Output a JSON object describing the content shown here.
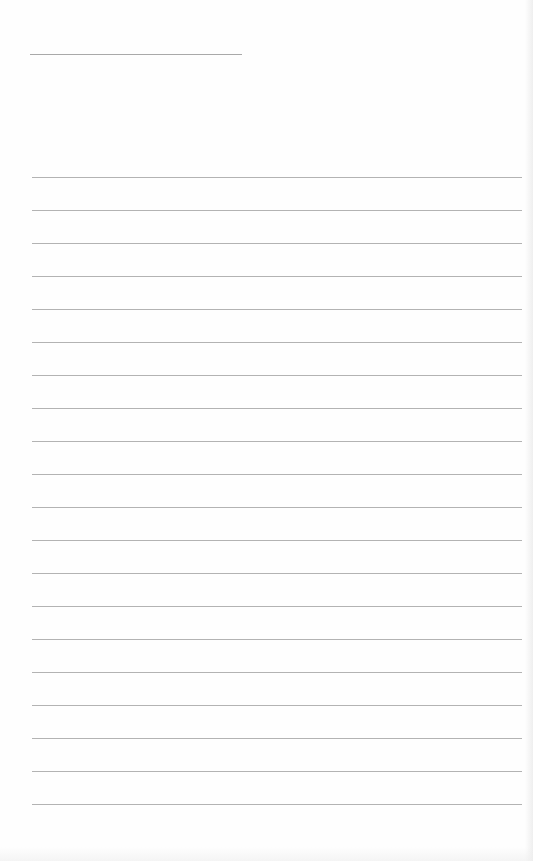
{
  "document": {
    "type": "blank lined page",
    "header_line": {
      "visible": true
    },
    "ruled_lines": {
      "count": 20,
      "spacing_px": 33,
      "color": "#b3b3b3"
    },
    "text_content": []
  }
}
